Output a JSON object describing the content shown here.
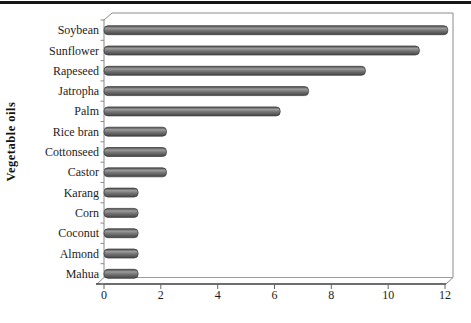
{
  "page": {
    "background": "#ffffff",
    "top_rule_color": "#161616"
  },
  "chart_data": {
    "type": "bar",
    "orientation": "horizontal",
    "title": "",
    "ylabel": "Vegetable oils",
    "xlabel": "",
    "categories": [
      "Soybean",
      "Sunflower",
      "Rapeseed",
      "Jatropha",
      "Palm",
      "Rice bran",
      "Cottonseed",
      "Castor",
      "Karang",
      "Corn",
      "Coconut",
      "Almond",
      "Mahua"
    ],
    "values": [
      12.1,
      11.1,
      9.2,
      7.2,
      6.2,
      2.2,
      2.2,
      2.2,
      1.2,
      1.2,
      1.2,
      1.2,
      1.2
    ],
    "xlim": [
      0,
      12
    ],
    "xticks": [
      0,
      2,
      4,
      6,
      8,
      10,
      12
    ],
    "grid": false,
    "legend": false,
    "colors": {
      "bar_gradient_top": "#4a4a4a",
      "bar_gradient_light": "#9c9c9c",
      "bar_gradient_mid": "#747474",
      "bar_gradient_bottom": "#454545",
      "bar_outline": "#3f3f3f",
      "frame": "#8a8a8a",
      "frame_back": "#9c9c9c",
      "axis_front": "#3c3c3c",
      "tick": "#666666",
      "text": "#1c1c1c"
    }
  }
}
